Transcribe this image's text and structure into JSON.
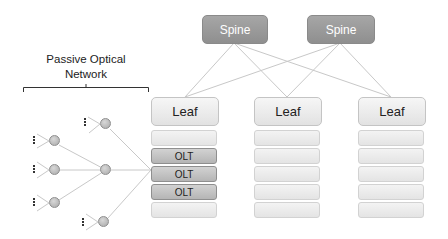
{
  "diagram": {
    "spines": [
      {
        "label": "Spine"
      },
      {
        "label": "Spine"
      }
    ],
    "leaves": [
      {
        "label": "Leaf",
        "slots": [
          "",
          "OLT",
          "OLT",
          "OLT",
          ""
        ]
      },
      {
        "label": "Leaf",
        "slots": [
          "",
          "",
          "",
          "",
          ""
        ]
      },
      {
        "label": "Leaf",
        "slots": [
          "",
          "",
          "",
          "",
          ""
        ]
      }
    ],
    "pon": {
      "title_line1": "Passive Optical",
      "title_line2": "Network"
    },
    "ellipsis_glyph": "⋮",
    "colors": {
      "spine_fill": "#9b9b9b",
      "leaf_fill": "#ececec",
      "olt_fill": "#c2c2c2",
      "link_line": "#c8c8c8",
      "node_fill": "#bdbdbd"
    }
  }
}
